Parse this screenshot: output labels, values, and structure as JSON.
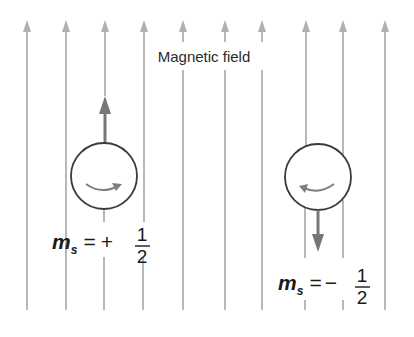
{
  "diagram": {
    "title": "Magnetic field",
    "colors": {
      "field_line": "#b5b5b5",
      "spin_arrow": "#7a7a7a",
      "circle": "#3a3a3a",
      "rotation_arrow": "#808080",
      "text": "#1a1a1a"
    },
    "field_lines_x": [
      27,
      66,
      105,
      144,
      183,
      225,
      262,
      306,
      343,
      385
    ],
    "field_direction": "up",
    "electrons": [
      {
        "label_var": "m",
        "label_sub": "s",
        "label_eq": "=",
        "label_sign": "+",
        "label_num": "1",
        "label_den": "2",
        "spin_direction": "up",
        "rotation": "counter-clockwise (arrow pointing right at bottom)"
      },
      {
        "label_var": "m",
        "label_sub": "s",
        "label_eq": "=",
        "label_sign": "−",
        "label_num": "1",
        "label_den": "2",
        "spin_direction": "down",
        "rotation": "clockwise (arrow pointing left at bottom)"
      }
    ]
  }
}
